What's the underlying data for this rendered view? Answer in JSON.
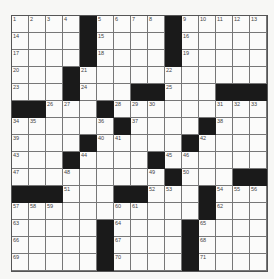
{
  "puzzle": {
    "rows": 15,
    "cols": 15,
    "colors": {
      "black": "#1a1a1a",
      "white": "#fbfbfa",
      "line": "#777777"
    },
    "grid": [
      [
        "1",
        "2",
        "3",
        "4",
        "#",
        "5",
        "6",
        "7",
        "8",
        "#",
        "9",
        "10",
        "11",
        "12",
        "13"
      ],
      [
        "14",
        "",
        "",
        "",
        "#",
        "15",
        "",
        "",
        "",
        "#",
        "16",
        "",
        "",
        "",
        ""
      ],
      [
        "17",
        "",
        "",
        "",
        "#",
        "18",
        "",
        "",
        "",
        "#",
        "19",
        "",
        "",
        "",
        ""
      ],
      [
        "20",
        "",
        "",
        "#",
        "21",
        "",
        "",
        "",
        "",
        "22",
        "",
        "",
        "",
        "",
        ""
      ],
      [
        "23",
        "",
        "",
        "#",
        "24",
        "",
        "",
        "#",
        "#",
        "25",
        "",
        "",
        "#",
        "#",
        "#"
      ],
      [
        "#",
        "#",
        "26",
        "27",
        "",
        "#",
        "28",
        "29",
        "30",
        "",
        "",
        "",
        "31",
        "32",
        "33"
      ],
      [
        "34",
        "35",
        "",
        "",
        "",
        "36",
        "#",
        "37",
        "",
        "",
        "",
        "#",
        "38",
        "",
        ""
      ],
      [
        "39",
        "",
        "",
        "",
        "#",
        "40",
        "41",
        "",
        "",
        "",
        "#",
        "42",
        "",
        "",
        ""
      ],
      [
        "43",
        "",
        "",
        "#",
        "44",
        "",
        "",
        "",
        "#",
        "45",
        "46",
        "",
        "",
        "",
        ""
      ],
      [
        "47",
        "",
        "",
        "48",
        "",
        "",
        "",
        "",
        "49",
        "#",
        "50",
        "",
        "",
        "#",
        "#"
      ],
      [
        "#",
        "#",
        "#",
        "51",
        "",
        "",
        "#",
        "#",
        "52",
        "53",
        "",
        "#",
        "54",
        "55",
        "56"
      ],
      [
        "57",
        "58",
        "59",
        "",
        "",
        "",
        "60",
        "61",
        "",
        "",
        "",
        "#",
        "62",
        "",
        ""
      ],
      [
        "63",
        "",
        "",
        "",
        "",
        "#",
        "64",
        "",
        "",
        "",
        "#",
        "65",
        "",
        "",
        ""
      ],
      [
        "66",
        "",
        "",
        "",
        "",
        "#",
        "67",
        "",
        "",
        "",
        "#",
        "68",
        "",
        "",
        ""
      ],
      [
        "69",
        "",
        "",
        "",
        "",
        "#",
        "70",
        "",
        "",
        "",
        "#",
        "71",
        "",
        "",
        ""
      ]
    ]
  }
}
